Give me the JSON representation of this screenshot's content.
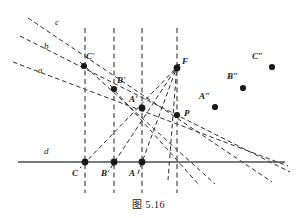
{
  "figure": {
    "caption": "图 5.16",
    "background_color": "#ffffff",
    "ink_color": "#1a1a1a",
    "dash_color": "#2b2b2b",
    "guide_color": "#555555",
    "baseline_color": "#4d4d4d"
  },
  "labels": {
    "line_a": "a",
    "line_b": "b",
    "line_c": "c",
    "line_d": "d",
    "point_C_prime": "C'",
    "point_B_prime": "B'",
    "point_A_prime": "A'",
    "point_F": "F",
    "point_P": "P",
    "point_C": "C",
    "point_B": "B",
    "point_A": "A",
    "point_A_dprime": "A″",
    "point_B_dprime": "B″",
    "point_C_dprime": "C″"
  },
  "geometry": {
    "baseline_d": {
      "x1": 18,
      "y1": 162,
      "x2": 285,
      "y2": 162
    },
    "vertical_guides": [
      {
        "name": "guide-C",
        "x": 85,
        "y1": 28,
        "y2": 193
      },
      {
        "name": "guide-B",
        "x": 114,
        "y1": 28,
        "y2": 193
      },
      {
        "name": "guide-A",
        "x": 142,
        "y1": 28,
        "y2": 193
      },
      {
        "name": "guide-F",
        "x": 177,
        "y1": 28,
        "y2": 193
      }
    ],
    "points": [
      {
        "name": "C-prime",
        "x": 84,
        "y": 66,
        "r": 3.1
      },
      {
        "name": "B-prime",
        "x": 114,
        "y": 89,
        "r": 3.1
      },
      {
        "name": "A-prime",
        "x": 142,
        "y": 108,
        "r": 3.4
      },
      {
        "name": "F",
        "x": 177,
        "y": 68,
        "r": 3.4
      },
      {
        "name": "P",
        "x": 177,
        "y": 115,
        "r": 3.1
      },
      {
        "name": "C",
        "x": 85,
        "y": 162,
        "r": 3.4
      },
      {
        "name": "B",
        "x": 114,
        "y": 162,
        "r": 3.4
      },
      {
        "name": "A",
        "x": 142,
        "y": 162,
        "r": 3.4
      },
      {
        "name": "A-double-prime",
        "x": 215,
        "y": 107,
        "r": 3.1
      },
      {
        "name": "B-double-prime",
        "x": 243,
        "y": 88,
        "r": 3.1
      },
      {
        "name": "C-double-prime",
        "x": 272,
        "y": 67,
        "r": 3.1
      }
    ],
    "pencil_lines": [
      {
        "name": "line-a",
        "x1": 13,
        "y1": 62,
        "x2": 288,
        "y2": 166
      },
      {
        "name": "line-b",
        "x1": 20,
        "y1": 36,
        "x2": 290,
        "y2": 172
      },
      {
        "name": "line-c",
        "x1": 28,
        "y1": 18,
        "x2": 272,
        "y2": 182
      },
      {
        "name": "ray-F-C",
        "x1": 180,
        "y1": 64,
        "x2": 80,
        "y2": 168
      },
      {
        "name": "ray-F-B",
        "x1": 179,
        "y1": 64,
        "x2": 108,
        "y2": 172
      },
      {
        "name": "ray-F-A",
        "x1": 178,
        "y1": 64,
        "x2": 137,
        "y2": 176
      },
      {
        "name": "ray-F-down",
        "x1": 177,
        "y1": 64,
        "x2": 168,
        "y2": 180
      },
      {
        "name": "line-CprimeA",
        "x1": 80,
        "y1": 62,
        "x2": 215,
        "y2": 184
      },
      {
        "name": "line-BprimeA",
        "x1": 110,
        "y1": 85,
        "x2": 200,
        "y2": 186
      }
    ],
    "label_positions": {
      "line_a": {
        "x": 38,
        "y": 66
      },
      "line_b": {
        "x": 44,
        "y": 42
      },
      "line_c": {
        "x": 55,
        "y": 18
      },
      "line_d": {
        "x": 44,
        "y": 147
      },
      "point_C_prime": {
        "x": 86,
        "y": 52
      },
      "point_B_prime": {
        "x": 117,
        "y": 76
      },
      "point_A_prime": {
        "x": 129,
        "y": 95
      },
      "point_F": {
        "x": 182,
        "y": 57
      },
      "point_P": {
        "x": 184,
        "y": 109
      },
      "point_C": {
        "x": 72,
        "y": 169
      },
      "point_B": {
        "x": 101,
        "y": 169
      },
      "point_A": {
        "x": 129,
        "y": 169
      },
      "point_A_dprime": {
        "x": 199,
        "y": 92
      },
      "point_B_dprime": {
        "x": 227,
        "y": 72
      },
      "point_C_dprime": {
        "x": 252,
        "y": 52
      }
    }
  }
}
